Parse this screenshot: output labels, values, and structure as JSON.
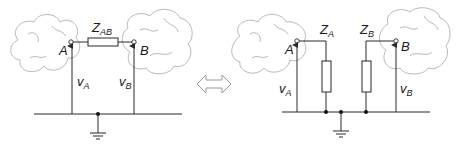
{
  "diagram": {
    "colors": {
      "wire": "#2a2a2a",
      "cloud": "#b8b8b8",
      "arrow": "#9a9a9a",
      "background": "#ffffff"
    },
    "left": {
      "node_a": {
        "label": "A"
      },
      "node_b": {
        "label": "B"
      },
      "impedance": {
        "label": "Z",
        "subscript": "AB"
      },
      "voltage_a": {
        "label": "v",
        "subscript": "A"
      },
      "voltage_b": {
        "label": "v",
        "subscript": "B"
      }
    },
    "equivalence_arrow": {
      "icon": "double-arrow-icon"
    },
    "right": {
      "node_a": {
        "label": "A"
      },
      "node_b": {
        "label": "B"
      },
      "impedance_a": {
        "label": "Z",
        "subscript": "A"
      },
      "impedance_b": {
        "label": "Z",
        "subscript": "B"
      },
      "voltage_a": {
        "label": "v",
        "subscript": "A"
      },
      "voltage_b": {
        "label": "v",
        "subscript": "B"
      }
    }
  }
}
